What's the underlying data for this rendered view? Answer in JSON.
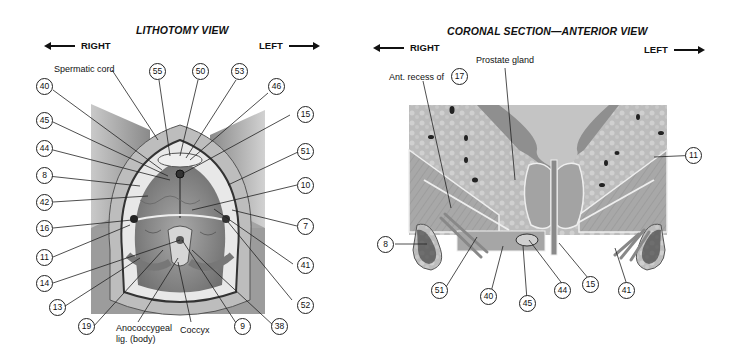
{
  "left_panel": {
    "title": "LITHOTOMY VIEW",
    "direction_right": "RIGHT",
    "direction_left": "LEFT",
    "text_labels": {
      "spermatic_cord": "Spermatic cord",
      "anococcygeal_1": "Anococcygeal",
      "anococcygeal_2": "lig. (body)",
      "coccyx": "Coccyx"
    },
    "callouts": {
      "c55": "55",
      "c50": "50",
      "c53": "53",
      "c46": "46",
      "c40": "40",
      "c15": "15",
      "c45": "45",
      "c44": "44",
      "c51": "51",
      "c8": "8",
      "c10": "10",
      "c42": "42",
      "c7": "7",
      "c16": "16",
      "c11": "11",
      "c41": "41",
      "c14": "14",
      "c13": "13",
      "c52": "52",
      "c19": "19",
      "c9": "9",
      "c38": "38"
    }
  },
  "right_panel": {
    "title": "CORONAL SECTION—ANTERIOR VIEW",
    "direction_right": "RIGHT",
    "direction_left": "LEFT",
    "text_labels": {
      "prostate": "Prostate gland",
      "ant_recess": "Ant. recess of"
    },
    "callouts": {
      "c17": "17",
      "c11": "11",
      "c8": "8",
      "c51": "51",
      "c40": "40",
      "c45": "45",
      "c44": "44",
      "c15": "15",
      "c41": "41"
    }
  }
}
